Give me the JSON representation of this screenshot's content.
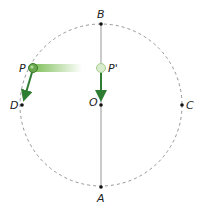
{
  "diagram": {
    "colors": {
      "circle": "#8a8a8a",
      "axis": "#999999",
      "arrow": "#2e7d32",
      "ball": "#6aa84f",
      "ball_ghost": "#cfe5c0",
      "trail_start": "#7fbf5a",
      "point": "#111111"
    },
    "circle": {
      "cx": 101,
      "cy": 105,
      "r": 81
    },
    "points": {
      "B": {
        "label": "B",
        "x": 101,
        "y": 24
      },
      "A": {
        "label": "A",
        "x": 101,
        "y": 187
      },
      "C": {
        "label": "C",
        "x": 182,
        "y": 105
      },
      "D": {
        "label": "D",
        "x": 22,
        "y": 105
      },
      "O": {
        "label": "O",
        "x": 101,
        "y": 105
      },
      "P": {
        "label": "P",
        "x": 33,
        "y": 68
      },
      "P_prime": {
        "label": "P'",
        "x": 101,
        "y": 68
      }
    },
    "arrows": [
      {
        "name": "velocity-P",
        "from": "P",
        "to": "near D"
      },
      {
        "name": "velocity-P-prime",
        "from": "P'",
        "to": "near O"
      }
    ]
  }
}
